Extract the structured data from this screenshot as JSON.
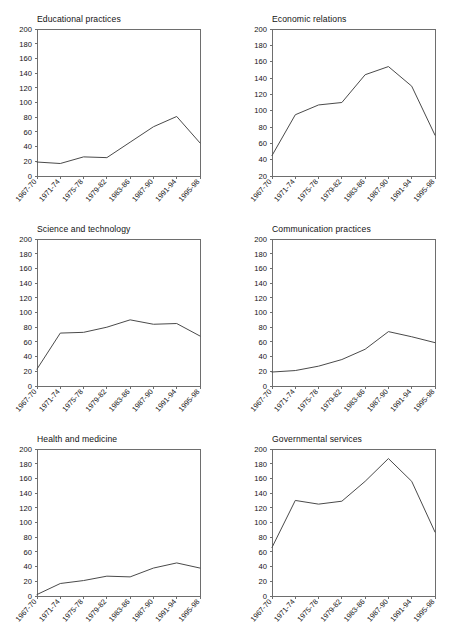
{
  "figure": {
    "layout": "2 columns x 3 rows of line charts",
    "background_color": "#ffffff",
    "line_color": "#4a4a4a",
    "axis_color": "#6e6e6e"
  },
  "chart_data": [
    {
      "type": "line",
      "title": "Educational practices",
      "xlabel": "",
      "ylabel": "",
      "categories": [
        "1967-70",
        "1971-74",
        "1975-78",
        "1979-82",
        "1983-86",
        "1987-90",
        "1991-94",
        "1995-98"
      ],
      "values": [
        19,
        17,
        26,
        25,
        46,
        67,
        81,
        45
      ],
      "ylim": [
        0,
        200
      ],
      "yticks": [
        0,
        20,
        40,
        60,
        80,
        100,
        120,
        140,
        160,
        180,
        200
      ],
      "grid": false,
      "legend": "none"
    },
    {
      "type": "line",
      "title": "Economic relations",
      "xlabel": "",
      "ylabel": "",
      "categories": [
        "1967-70",
        "1971-74",
        "1975-78",
        "1979-82",
        "1983-86",
        "1987-90",
        "1991-94",
        "1995-98"
      ],
      "values": [
        45,
        95,
        107,
        110,
        144,
        154,
        130,
        70
      ],
      "ylim": [
        20,
        200
      ],
      "yticks": [
        20,
        40,
        60,
        80,
        100,
        120,
        140,
        160,
        180,
        200
      ],
      "grid": false,
      "legend": "none"
    },
    {
      "type": "line",
      "title": "Science and technology",
      "xlabel": "",
      "ylabel": "",
      "categories": [
        "1967-70",
        "1971-74",
        "1975-78",
        "1979-82",
        "1983-86",
        "1987-90",
        "1991-94",
        "1995-98"
      ],
      "values": [
        23,
        72,
        73,
        80,
        90,
        84,
        85,
        68
      ],
      "ylim": [
        0,
        200
      ],
      "yticks": [
        0,
        20,
        40,
        60,
        80,
        100,
        120,
        140,
        160,
        180,
        200
      ],
      "grid": false,
      "legend": "none"
    },
    {
      "type": "line",
      "title": "Communication practices",
      "xlabel": "",
      "ylabel": "",
      "categories": [
        "1967-70",
        "1971-74",
        "1975-78",
        "1979-82",
        "1983-86",
        "1987-90",
        "1991-94",
        "1995-98"
      ],
      "values": [
        19,
        21,
        27,
        36,
        50,
        74,
        67,
        59
      ],
      "ylim": [
        0,
        200
      ],
      "yticks": [
        0,
        20,
        40,
        60,
        80,
        100,
        120,
        140,
        160,
        180,
        200
      ],
      "grid": false,
      "legend": "none"
    },
    {
      "type": "line",
      "title": "Health and medicine",
      "xlabel": "",
      "ylabel": "",
      "categories": [
        "1967-70",
        "1971-74",
        "1975-78",
        "1979-82",
        "1983-86",
        "1987-90",
        "1991-94",
        "1995-98"
      ],
      "values": [
        2,
        17,
        21,
        27,
        26,
        38,
        45,
        38
      ],
      "ylim": [
        0,
        200
      ],
      "yticks": [
        0,
        20,
        40,
        60,
        80,
        100,
        120,
        140,
        160,
        180,
        200
      ],
      "grid": false,
      "legend": "none"
    },
    {
      "type": "line",
      "title": "Governmental services",
      "xlabel": "",
      "ylabel": "",
      "categories": [
        "1967-70",
        "1971-74",
        "1975-78",
        "1979-82",
        "1983-86",
        "1987-90",
        "1991-94",
        "1995-98"
      ],
      "values": [
        66,
        130,
        125,
        129,
        156,
        187,
        156,
        87
      ],
      "ylim": [
        0,
        200
      ],
      "yticks": [
        0,
        20,
        40,
        60,
        80,
        100,
        120,
        140,
        160,
        180,
        200
      ],
      "grid": false,
      "legend": "none"
    }
  ]
}
